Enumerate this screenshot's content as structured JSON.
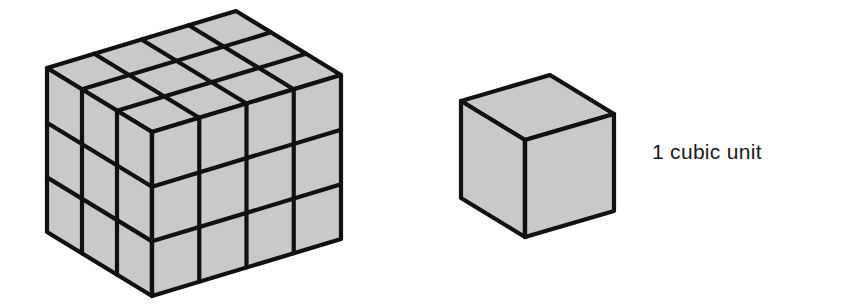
{
  "figure": {
    "background": "#ffffff",
    "fill_color": "#c9c9c9",
    "stroke_color": "#111111",
    "rectangular_prism": {
      "name": "Rectangular prism built from unit cubes",
      "length_units": 4,
      "width_units": 3,
      "height_units": 3,
      "total_cubes": 36,
      "front_top_vertex": [
        152,
        132
      ],
      "length_step": [
        47.25,
        -14.25
      ],
      "depth_step": [
        -35,
        -21.33
      ],
      "height_step": 54.67
    },
    "unit_cube": {
      "name": "Single unit cube",
      "front_top_vertex": [
        525,
        140
      ],
      "length_step": [
        89,
        -26
      ],
      "depth_step": [
        -64,
        -39
      ],
      "height_step": 97
    },
    "label": "1 cubic unit"
  }
}
